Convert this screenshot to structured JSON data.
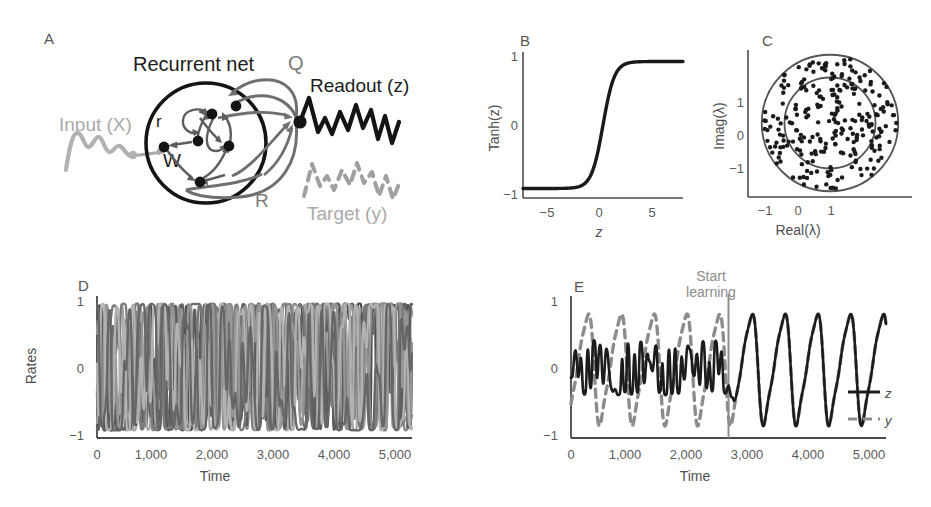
{
  "figure": {
    "panels": [
      "A",
      "B",
      "C",
      "D",
      "E"
    ]
  },
  "panel_a": {
    "letter": "A",
    "title": "Recurrent net",
    "q_label": "Q",
    "r_label": "R",
    "w_label": "W",
    "r_node_label": "r",
    "input_label": "Input (X)",
    "readout_label": "Readout (z)",
    "target_label": "Target (y)",
    "colors": {
      "network": "#1c1c1c",
      "feedback": "#6f6f6f",
      "input": "#b0b0b0",
      "target": "#a0a0a0",
      "readout": "#141414"
    }
  },
  "chart_data": [
    {
      "panel": "B",
      "letter": "B",
      "type": "line",
      "title": "",
      "xlabel": "z",
      "ylabel": "Tanh(z)",
      "xlim": [
        -7,
        7
      ],
      "ylim": [
        -1.15,
        1.15
      ],
      "xticks": [
        -5,
        0,
        5
      ],
      "xticklabels": [
        "−5",
        "0",
        "5"
      ],
      "yticks": [
        -1,
        0,
        1
      ],
      "yticklabels": [
        "−1",
        "0",
        "1"
      ],
      "grid": false,
      "series": [
        {
          "name": "tanh",
          "color": "#1a1a1a",
          "x": [
            -7,
            -6.5,
            -6,
            -5.5,
            -5,
            -4.5,
            -4,
            -3.5,
            -3,
            -2.5,
            -2,
            -1.5,
            -1,
            -0.5,
            0,
            0.5,
            1,
            1.5,
            2,
            2.5,
            3,
            3.5,
            4,
            4.5,
            5,
            5.5,
            6,
            6.5,
            7
          ],
          "values": [
            -1.0,
            -1.0,
            -1.0,
            -1.0,
            -0.999,
            -0.9997,
            -0.9993,
            -0.9982,
            -0.995,
            -0.9866,
            -0.964,
            -0.905,
            -0.762,
            -0.462,
            0.0,
            0.462,
            0.762,
            0.905,
            0.964,
            0.9866,
            0.995,
            0.9982,
            0.9993,
            0.9997,
            0.999,
            1.0,
            1.0,
            1.0,
            1.0
          ]
        }
      ]
    },
    {
      "panel": "C",
      "letter": "C",
      "type": "scatter",
      "title": "",
      "xlabel": "Real(λ)",
      "ylabel": "Imag(λ)",
      "xlim": [
        -1.75,
        1.75
      ],
      "ylim": [
        -1.75,
        1.75
      ],
      "xticks": [
        -1,
        0,
        1
      ],
      "xticklabels": [
        "−1",
        "0",
        "1"
      ],
      "yticks": [
        -1,
        0,
        1
      ],
      "yticklabels": [
        "−1",
        "0",
        "1"
      ],
      "grid": false,
      "n_points": 250,
      "point_color": "#1a1a1a",
      "circles": [
        {
          "name": "outer-circle",
          "radius": 1.5,
          "color": "#555555"
        },
        {
          "name": "inner-circle",
          "radius": 1.0,
          "color": "#555555"
        }
      ]
    },
    {
      "panel": "D",
      "letter": "D",
      "type": "line",
      "title": "",
      "xlabel": "Time",
      "ylabel": "Rates",
      "xlim": [
        0,
        5000
      ],
      "ylim": [
        -1.12,
        1.12
      ],
      "xticks": [
        0,
        1000,
        2000,
        3000,
        4000,
        5000
      ],
      "xticklabels": [
        "0",
        "1,000",
        "2,000",
        "3,000",
        "4,000",
        "5,000"
      ],
      "yticks": [
        -1,
        0,
        1
      ],
      "yticklabels": [
        "−1",
        "0",
        "1"
      ],
      "grid": false,
      "n_series": 9,
      "series_colors": [
        "#4f4f4f",
        "#6b6b6b",
        "#8a8a8a",
        "#a5a5a5",
        "#5d5d5d",
        "#7a7a7a",
        "#959595",
        "#b2b2b2",
        "#666666"
      ],
      "description": "Chaotic spontaneous activity of nine example network units"
    },
    {
      "panel": "E",
      "letter": "E",
      "type": "line",
      "title": "",
      "xlabel": "Time",
      "ylabel": "",
      "xlim": [
        0,
        5000
      ],
      "ylim": [
        -1.12,
        1.12
      ],
      "xticks": [
        0,
        1000,
        2000,
        3000,
        4000,
        5000
      ],
      "xticklabels": [
        "0",
        "1,000",
        "2,000",
        "3,000",
        "4,000",
        "5,000"
      ],
      "yticks": [
        -1,
        0,
        1
      ],
      "yticklabels": [
        "−1",
        "0",
        "1"
      ],
      "grid": false,
      "annotation": "Start\nlearning",
      "annotation_x": 2500,
      "series": [
        {
          "name": "z",
          "label": "z",
          "color": "#1c1c1c",
          "style": "solid"
        },
        {
          "name": "y",
          "label": "y",
          "color": "#8c8c8c",
          "style": "dashed"
        }
      ],
      "legend_position": "bottom-right"
    }
  ]
}
